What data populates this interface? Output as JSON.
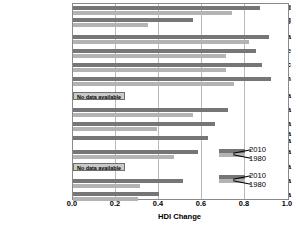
{
  "chart_data": {
    "type": "bar",
    "orientation": "horizontal",
    "title": "",
    "xlabel": "HDI Change",
    "ylabel": "",
    "xlim": [
      0.0,
      1.0
    ],
    "xticks": [
      "0.0",
      "0.2",
      "0.4",
      "0.6",
      "0.8",
      "1.0"
    ],
    "xtick_values": [
      0.0,
      0.2,
      0.4,
      0.6,
      0.8,
      1.0
    ],
    "grid": "vertical",
    "legend_position": "inside-right",
    "series": [
      {
        "name": "2010",
        "color": "#767676"
      },
      {
        "name": "1980",
        "color": "#b3b3b3"
      }
    ],
    "categories": [
      "Developed",
      "Developing",
      "North America",
      "Europe",
      "South Pacific",
      "Japan",
      "Russia",
      "Latin America",
      "East Asia",
      "Southwest Asia and North Africa",
      "Southeast Asia",
      "Central Asia",
      "South Asia",
      "Sub-Saharan Africa"
    ],
    "rows": [
      {
        "label": "Developed",
        "v2010": 0.87,
        "v1980": 0.74,
        "no_data": false
      },
      {
        "label": "Developing",
        "v2010": 0.56,
        "v1980": 0.35,
        "no_data": false
      },
      {
        "label": "North America",
        "v2010": 0.91,
        "v1980": 0.82,
        "no_data": false
      },
      {
        "label": "Europe",
        "v2010": 0.85,
        "v1980": 0.71,
        "no_data": false
      },
      {
        "label": "South Pacific",
        "v2010": 0.88,
        "v1980": 0.71,
        "no_data": false
      },
      {
        "label": "Japan",
        "v2010": 0.92,
        "v1980": 0.75,
        "no_data": false
      },
      {
        "label": "Russia",
        "v2010": null,
        "v1980": null,
        "no_data": true
      },
      {
        "label": "Latin America",
        "v2010": 0.72,
        "v1980": 0.56,
        "no_data": false
      },
      {
        "label": "East Asia",
        "v2010": 0.66,
        "v1980": 0.39,
        "no_data": false
      },
      {
        "label": "Southwest Asia and North Africa",
        "v2010": 0.63,
        "v1980": 0.0,
        "no_data": false
      },
      {
        "label": "Southeast Asia",
        "v2010": 0.58,
        "v1980": 0.47,
        "no_data": false
      },
      {
        "label": "Central Asia",
        "v2010": null,
        "v1980": null,
        "no_data": true
      },
      {
        "label": "South Asia",
        "v2010": 0.51,
        "v1980": 0.31,
        "no_data": false
      },
      {
        "label": "Sub-Saharan Africa",
        "v2010": 0.4,
        "v1980": 0.3,
        "no_data": false
      }
    ]
  },
  "labels": {
    "developed": "Developed",
    "developing": "Developing",
    "north_america": "North America",
    "europe": "Europe",
    "south_pacific": "South Pacific",
    "japan": "Japan",
    "russia": "Russia",
    "latin_america": "Latin America",
    "east_asia": "East Asia",
    "southwest_asia_line1": "Southwest Asia",
    "southwest_asia_line2": "and North Africa",
    "southeast_asia": "Southeast Asia",
    "central_asia": "Central Asia",
    "south_asia": "South Asia",
    "sub_saharan_africa": "Sub-Saharan Africa"
  },
  "no_data_text": "No data available",
  "axis": {
    "title": "HDI Change",
    "tick_0": "0.0",
    "tick_1": "0.2",
    "tick_2": "0.4",
    "tick_3": "0.6",
    "tick_4": "0.8",
    "tick_5": "1.0"
  },
  "legend": {
    "upper_2010": "2010",
    "upper_1980": "1980",
    "lower_2010": "2010",
    "lower_1980": "1980"
  },
  "colors": {
    "series_2010": "#767676",
    "series_1980": "#b3b3b3",
    "grid": "#b9b9b9",
    "frame": "#8a8a8a",
    "nodata_fill": "#c9c9c9"
  }
}
